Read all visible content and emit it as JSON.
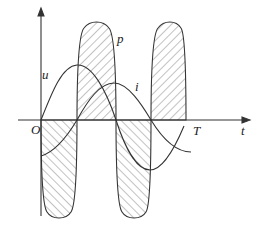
{
  "diagram": {
    "title": "",
    "labels": {
      "voltage": "u",
      "current": "i",
      "power": "p",
      "origin": "O",
      "period": "T",
      "time_axis": "t"
    },
    "curves": [
      {
        "name": "u",
        "description": "sinusoidal voltage, starts at 0, peak near quarter period"
      },
      {
        "name": "i",
        "description": "sinusoidal current lagging voltage by quarter period"
      },
      {
        "name": "p",
        "description": "instantaneous power p = u*i, double frequency, alternating positive/negative hatched lobes"
      }
    ],
    "colors": {
      "stroke": "#333333",
      "hatch": "#555555",
      "background": "#ffffff"
    }
  }
}
